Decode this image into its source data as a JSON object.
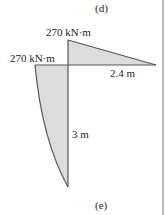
{
  "figure": {
    "top_caption": "(d)",
    "bottom_caption": "(e)",
    "moment_top_label": "270 kN·m",
    "moment_left_label": "270 kN·m",
    "horizontal_length_label": "2.4 m",
    "vertical_length_label": "3 m"
  },
  "colors": {
    "fill": "#dcdcdc",
    "stroke": "#555555",
    "border": "#666666"
  }
}
